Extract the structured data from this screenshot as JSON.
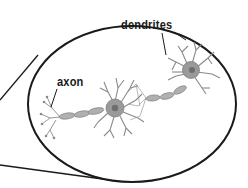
{
  "diagram": {
    "labels": {
      "dendrites": "dendrites",
      "axon": "axon"
    },
    "colors": {
      "outline": "#1a1a1a",
      "neuron": "#8a8a8a",
      "cell_body": "#9a9a9a",
      "nucleus": "#6e6e6e"
    }
  }
}
